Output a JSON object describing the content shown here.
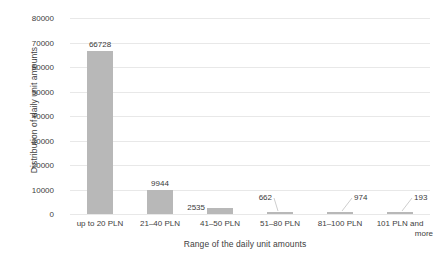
{
  "chart_data": {
    "type": "bar",
    "title": "",
    "xlabel": "Range of the daily unit amounts",
    "ylabel": "Distribution of daily unit amounts",
    "categories": [
      "up to 20 PLN",
      "21–40 PLN",
      "41–50 PLN",
      "51–80 PLN",
      "81–100 PLN",
      "101 PLN and more"
    ],
    "values": [
      66728,
      9944,
      2535,
      662,
      974,
      193
    ],
    "value_labels": [
      "66728",
      "9944",
      "2535",
      "662",
      "974",
      "193"
    ],
    "ylim": [
      0,
      80000
    ],
    "yticks": [
      0,
      10000,
      20000,
      30000,
      40000,
      50000,
      60000,
      70000,
      80000
    ],
    "ytick_labels": [
      "0",
      "10000",
      "20000",
      "30000",
      "40000",
      "50000",
      "60000",
      "70000",
      "80000"
    ],
    "grid": true,
    "legend": false,
    "bar_color": "#b8b8b8",
    "gridline_color": "#e8e8e8",
    "text_color": "#404040"
  },
  "labels": {
    "last_category_line1": "101 PLN and",
    "last_category_line2": "more"
  }
}
